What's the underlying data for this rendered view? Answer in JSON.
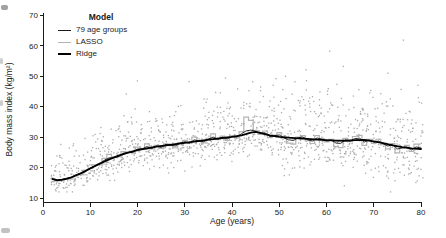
{
  "chart_data": {
    "type": "scatter",
    "title": "",
    "xlabel": "Age (years)",
    "ylabel": "Body mass index (kg/m²)",
    "xlim": [
      0,
      80
    ],
    "ylim": [
      10,
      70
    ],
    "xticks": [
      0,
      10,
      20,
      30,
      40,
      50,
      60,
      70,
      80
    ],
    "yticks": [
      10,
      20,
      30,
      40,
      50,
      60,
      70
    ],
    "grid": false,
    "legend": {
      "title": "Model",
      "position": "top-left",
      "entries": [
        {
          "label": "79 age groups",
          "color": "#1a1a1a",
          "stroke_width": 1
        },
        {
          "label": "LASSO",
          "color": "#b4b4b4",
          "stroke_width": 1.3
        },
        {
          "label": "Ridge",
          "color": "#000000",
          "stroke_width": 2
        }
      ]
    },
    "series": {
      "ridge": {
        "name": "Ridge",
        "color": "#000000",
        "width": 1.8,
        "ages": [
          2,
          3,
          4,
          5,
          6,
          8,
          10,
          12,
          14,
          16,
          18,
          20,
          22,
          24,
          26,
          28,
          30,
          32,
          34,
          36,
          38,
          40,
          42,
          44,
          45,
          46,
          48,
          50,
          52,
          54,
          56,
          58,
          60,
          62,
          64,
          66,
          68,
          70,
          72,
          74,
          76,
          78,
          80
        ],
        "values": [
          16.2,
          15.9,
          16.0,
          16.3,
          16.8,
          18.1,
          19.7,
          21.3,
          22.7,
          23.9,
          24.9,
          25.7,
          26.3,
          26.9,
          27.3,
          27.7,
          28.1,
          28.5,
          28.9,
          29.3,
          29.7,
          30.1,
          30.6,
          31.5,
          31.7,
          31.4,
          30.6,
          30.1,
          29.8,
          29.6,
          29.4,
          29.2,
          29.0,
          28.85,
          28.8,
          29.0,
          29.1,
          28.6,
          28.0,
          27.3,
          26.7,
          26.3,
          26.1
        ]
      },
      "age_groups": {
        "name": "79 age groups",
        "color": "#161616",
        "width": 0.9,
        "age_start": 2,
        "deviation": [
          0.1,
          -0.2,
          0.0,
          0.2,
          -0.1,
          0.0,
          0.1,
          -0.2,
          0.2,
          0.0,
          -0.1,
          0.4,
          0.5,
          -0.1,
          -0.3,
          0.3,
          0.0,
          -0.3,
          0.4,
          0.1,
          0.6,
          -0.4,
          0.2,
          -0.5,
          0.3,
          -0.2,
          -0.6,
          0.1,
          0.4,
          -0.3,
          0.6,
          0.0,
          -0.4,
          0.2,
          0.7,
          -0.2,
          0.3,
          -0.5,
          0.1,
          -0.3,
          0.5,
          1.0,
          0.8,
          0.2,
          -0.2,
          0.4,
          -0.4,
          0.1,
          0.6,
          -0.2,
          -0.7,
          -0.8,
          0.2,
          0.5,
          -0.3,
          -0.6,
          0.5,
          0.2,
          -0.3,
          0.1,
          -0.8,
          -0.9,
          0.3,
          -0.2,
          0.5,
          0.6,
          -0.7,
          0.2,
          -0.3,
          0.4,
          -0.2,
          -0.6,
          0.3,
          -0.9,
          -0.2,
          0.3,
          -0.5,
          0.6,
          0.2
        ]
      },
      "lasso": {
        "name": "LASSO",
        "color": "#b4b4b4",
        "width": 1.2,
        "age_start": 2,
        "deviation": [
          0.2,
          -0.3,
          -0.3,
          0.0,
          -0.2,
          0.1,
          -0.2,
          0.3,
          0.0,
          0.4,
          -0.2,
          1.0,
          1.6,
          0.2,
          -0.3,
          0.8,
          0.2,
          -0.4,
          1.0,
          0.3,
          1.5,
          -0.5,
          0.4,
          -0.8,
          0.5,
          -0.3,
          -1.2,
          0.3,
          0.8,
          -0.4,
          1.5,
          0.2,
          -0.8,
          0.5,
          1.8,
          -0.3,
          0.6,
          -1.0,
          0.4,
          -0.6,
          1.2,
          5.5,
          4.0,
          0.5,
          -0.5,
          1.0,
          -0.8,
          0.3,
          1.4,
          -0.3,
          -1.8,
          -2.0,
          0.4,
          1.0,
          -0.6,
          -1.4,
          1.3,
          0.4,
          -0.6,
          0.3,
          -2.0,
          -2.3,
          0.8,
          -0.4,
          1.2,
          1.5,
          -1.8,
          0.4,
          -0.7,
          1.0,
          -0.5,
          -1.5,
          0.6,
          -2.2,
          -0.4,
          0.8,
          -1.0,
          1.5,
          0.5
        ]
      }
    },
    "scatter_points": {
      "color": "#a3a3a3",
      "dot_size": 1.3,
      "seed": 987654321,
      "age_min": 2,
      "age_max": 80,
      "per_age_min": 12,
      "per_age_max": 18,
      "base_sd": 2.1,
      "sd_per_year": 0.045,
      "skew_up": 1.8,
      "outlier_chance": 0.01,
      "outlier_boost": 12,
      "clamp": [
        12,
        62
      ]
    },
    "axis_color": "#1a1a1a",
    "tick_font_px": 8
  }
}
